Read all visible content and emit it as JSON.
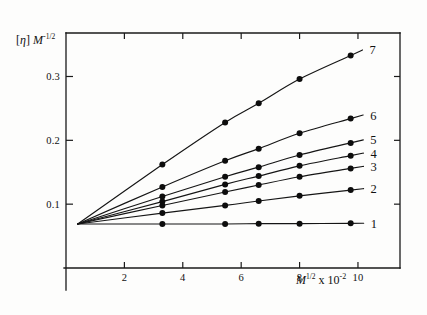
{
  "figure": {
    "background_color": "#fdfdfc",
    "ink_color": "#111111",
    "ylabel_bracket_open": "[",
    "ylabel_eta": "η",
    "ylabel_bracket_close": "]",
    "ylabel_m": "M",
    "ylabel_exp_sign": "-",
    "ylabel_exp_frac": "1/2",
    "xlabel_m": "M",
    "xlabel_exp_frac": "1/2",
    "xlabel_times": "x",
    "xlabel_base": "10",
    "xlabel_exp": "-2"
  },
  "axes": {
    "x_ticks": [
      2,
      4,
      6,
      8,
      10
    ],
    "x_tick_labels": [
      "2",
      "4",
      "6",
      "8",
      "10"
    ],
    "y_ticks": [
      0.1,
      0.2,
      0.3
    ],
    "y_tick_labels": [
      "0.1",
      "0.2",
      "0.3"
    ],
    "xlim": [
      0,
      11.2
    ],
    "ylim": [
      0.0,
      0.365
    ],
    "grid": false
  },
  "chart_data": {
    "type": "line",
    "title": "",
    "xlabel": "M^(1/2) x 10^-2",
    "ylabel": "[η] M^(-1/2)",
    "xlim": [
      0,
      11.2
    ],
    "ylim": [
      0.0,
      0.365
    ],
    "grid": false,
    "legend_position": "right-inline",
    "x_ticks": [
      2,
      4,
      6,
      8,
      10
    ],
    "y_ticks": [
      0.1,
      0.2,
      0.3
    ],
    "origin_point": {
      "x": 0.4,
      "y": 0.069
    },
    "series": [
      {
        "name": "1",
        "label": "1",
        "x": [
          0.4,
          3.3,
          5.45,
          6.6,
          8.0,
          9.75
        ],
        "y": [
          0.069,
          0.069,
          0.069,
          0.0695,
          0.0695,
          0.07
        ]
      },
      {
        "name": "2",
        "label": "2",
        "x": [
          0.4,
          3.3,
          5.45,
          6.6,
          8.0,
          9.75
        ],
        "y": [
          0.069,
          0.086,
          0.098,
          0.105,
          0.113,
          0.122
        ]
      },
      {
        "name": "3",
        "label": "3",
        "x": [
          0.4,
          3.3,
          5.45,
          6.6,
          8.0,
          9.75
        ],
        "y": [
          0.069,
          0.098,
          0.119,
          0.13,
          0.143,
          0.156
        ]
      },
      {
        "name": "4",
        "label": "4",
        "x": [
          0.4,
          3.3,
          5.45,
          6.6,
          8.0,
          9.75
        ],
        "y": [
          0.069,
          0.104,
          0.131,
          0.144,
          0.16,
          0.176
        ]
      },
      {
        "name": "5",
        "label": "5",
        "x": [
          0.4,
          3.3,
          5.45,
          6.6,
          8.0,
          9.75
        ],
        "y": [
          0.069,
          0.112,
          0.143,
          0.158,
          0.177,
          0.196
        ]
      },
      {
        "name": "6",
        "label": "6",
        "x": [
          0.4,
          3.3,
          5.45,
          6.6,
          8.0,
          9.75
        ],
        "y": [
          0.069,
          0.127,
          0.168,
          0.187,
          0.211,
          0.234
        ]
      },
      {
        "name": "7",
        "label": "7",
        "x": [
          0.4,
          3.3,
          5.45,
          6.6,
          8.0,
          9.75
        ],
        "y": [
          0.069,
          0.162,
          0.228,
          0.258,
          0.296,
          0.333
        ]
      }
    ]
  }
}
